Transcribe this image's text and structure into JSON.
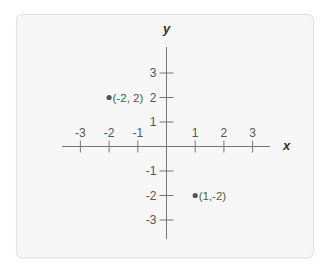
{
  "chart_data": {
    "type": "scatter",
    "title": "",
    "xlabel": "x",
    "ylabel": "y",
    "xlim": [
      -3,
      3
    ],
    "ylim": [
      -3,
      3
    ],
    "grid": false,
    "x_ticks": [
      -3,
      -2,
      -1,
      1,
      2,
      3
    ],
    "y_ticks": [
      3,
      2,
      1,
      -1,
      -2,
      -3
    ],
    "points": [
      {
        "x": -2,
        "y": 2,
        "label": "(-2, 2)"
      },
      {
        "x": 1,
        "y": -2,
        "label": "(1,-2)"
      }
    ]
  },
  "colors": {
    "background": "#ffffff",
    "panel": "#f7f7f7",
    "axis": "#777777",
    "point": "#555555",
    "text": "#555555"
  }
}
